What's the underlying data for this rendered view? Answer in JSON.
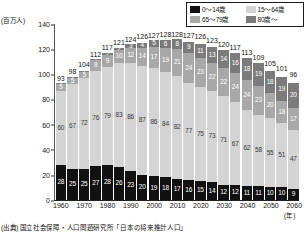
{
  "unit_label": "(百万人)",
  "year_unit_label": "(年)",
  "source_note": "(出典) 国立社会保障・人口問題研究所「日本の将来推計人口」",
  "legend": {
    "items": [
      {
        "label": "0〜14歳",
        "color": "#111111",
        "key": "age_0_14"
      },
      {
        "label": "15〜64歳",
        "color": "#d4d4d4",
        "key": "age_15_64"
      },
      {
        "label": "65〜79歳",
        "color": "#a8a8a8",
        "key": "age_65_79"
      },
      {
        "label": "80歳〜",
        "color": "#7b7b7b",
        "key": "age_80_plus"
      }
    ]
  },
  "chart_data": {
    "type": "bar",
    "stacked": true,
    "title": "",
    "xlabel": "(年)",
    "ylabel": "(百万人)",
    "ylim": [
      0,
      140
    ],
    "yticks": [
      0,
      20,
      40,
      60,
      80,
      100,
      120,
      140
    ],
    "grid": false,
    "legend_position": "top-right",
    "categories": [
      "1960",
      "1965",
      "1970",
      "1975",
      "1980",
      "1985",
      "1990",
      "1995",
      "2000",
      "2005",
      "2010",
      "2015",
      "2020",
      "2025",
      "2030",
      "2035",
      "2040",
      "2045",
      "2050",
      "2055",
      "2060"
    ],
    "series": [
      {
        "name": "0〜14歳",
        "color": "#111111",
        "values": [
          28,
          25,
          25,
          27,
          28,
          26,
          23,
          20,
          19,
          18,
          17,
          16,
          15,
          14,
          12,
          12,
          11,
          11,
          10,
          10,
          9
        ]
      },
      {
        "name": "15〜64歳",
        "color": "#d4d4d4",
        "values": [
          60,
          67,
          72,
          76,
          79,
          83,
          86,
          87,
          86,
          84,
          82,
          77,
          75,
          73,
          71,
          67,
          62,
          58,
          55,
          51,
          47
        ]
      },
      {
        "name": "65〜79歳",
        "color": "#a8a8a8",
        "values": [
          5,
          5,
          5,
          8,
          9,
          10,
          12,
          14,
          17,
          19,
          21,
          24,
          23,
          22,
          22,
          24,
          24,
          23,
          20,
          18,
          17
        ]
      },
      {
        "name": "80歳〜",
        "color": "#7b7b7b",
        "values": [
          1,
          1,
          1,
          1,
          2,
          2,
          3,
          4,
          5,
          6,
          8,
          9,
          11,
          13,
          14,
          16,
          18,
          19,
          18,
          19,
          20
        ]
      }
    ],
    "totals": [
      93,
      98,
      104,
      112,
      117,
      121,
      124,
      126,
      127,
      128,
      128,
      127,
      126,
      123,
      120,
      117,
      113,
      109,
      105,
      101,
      96
    ],
    "totals_label_prefix": "",
    "value_labels_shown": true
  }
}
